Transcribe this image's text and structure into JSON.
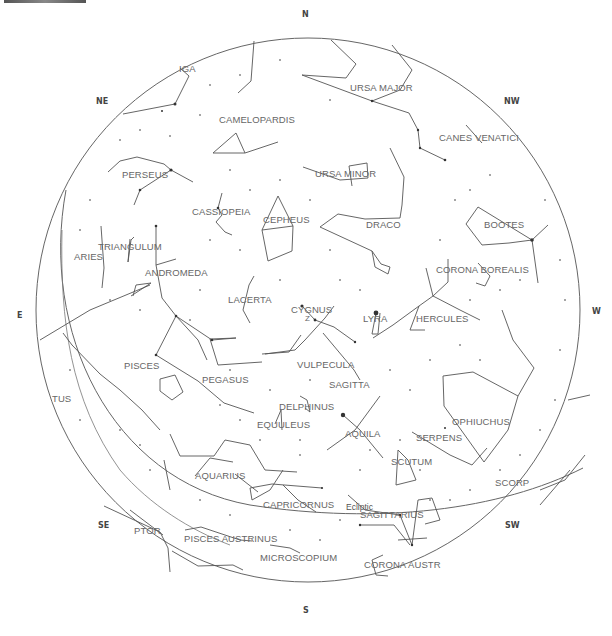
{
  "directions": [
    {
      "label": "N",
      "x": 306,
      "y": 14
    },
    {
      "label": "NE",
      "x": 98,
      "y": 101
    },
    {
      "label": "NW",
      "x": 505,
      "y": 101
    },
    {
      "label": "E",
      "x": 17,
      "y": 314
    },
    {
      "label": "W",
      "x": 594,
      "y": 311
    },
    {
      "label": "SE",
      "x": 99,
      "y": 524
    },
    {
      "label": "SW",
      "x": 506,
      "y": 524
    },
    {
      "label": "S",
      "x": 305,
      "y": 610
    }
  ],
  "constellations": [
    {
      "name": "IGA",
      "x": 179,
      "y": 66
    },
    {
      "name": "URSA MAJOR",
      "x": 350,
      "y": 85
    },
    {
      "name": "CAMELOPARDIS",
      "x": 219,
      "y": 117
    },
    {
      "name": "CANES VENATICI",
      "x": 439,
      "y": 135
    },
    {
      "name": "PERSEUS",
      "x": 122,
      "y": 172
    },
    {
      "name": "URSA MINOR",
      "x": 315,
      "y": 171
    },
    {
      "name": "CASSIOPEIA",
      "x": 192,
      "y": 209
    },
    {
      "name": "CEPHEUS",
      "x": 263,
      "y": 217
    },
    {
      "name": "DRACO",
      "x": 366,
      "y": 222
    },
    {
      "name": "BOOTES",
      "x": 484,
      "y": 222
    },
    {
      "name": "TRIANGULUM",
      "x": 98,
      "y": 244
    },
    {
      "name": "ARIES",
      "x": 74,
      "y": 251
    },
    {
      "name": "ANDROMEDA",
      "x": 145,
      "y": 268
    },
    {
      "name": "CORONA BOREALIS",
      "x": 436,
      "y": 267
    },
    {
      "name": "LACERTA",
      "x": 228,
      "y": 296
    },
    {
      "name": "CYGNUS",
      "x": 291,
      "y": 306
    },
    {
      "name": "LYRA",
      "x": 363,
      "y": 316
    },
    {
      "name": "HERCULES",
      "x": 416,
      "y": 315
    },
    {
      "name": "PISCES",
      "x": 124,
      "y": 361
    },
    {
      "name": "VULPECULA",
      "x": 297,
      "y": 361
    },
    {
      "name": "PEGASUS",
      "x": 202,
      "y": 376
    },
    {
      "name": "SAGITTA",
      "x": 329,
      "y": 380
    },
    {
      "name": "TUS",
      "x": 52,
      "y": 395
    },
    {
      "name": "DELPHINUS",
      "x": 279,
      "y": 403
    },
    {
      "name": "OPHIUCHUS",
      "x": 452,
      "y": 418
    },
    {
      "name": "EQUULEUS",
      "x": 257,
      "y": 420
    },
    {
      "name": "AQUILA",
      "x": 345,
      "y": 430
    },
    {
      "name": "SERPENS",
      "x": 416,
      "y": 433
    },
    {
      "name": "SCUTUM",
      "x": 391,
      "y": 458
    },
    {
      "name": "AQUARIUS",
      "x": 195,
      "y": 471
    },
    {
      "name": "SCORP",
      "x": 495,
      "y": 478
    },
    {
      "name": "CAPRICORNUS",
      "x": 263,
      "y": 501
    },
    {
      "name": "SAGITTARIUS",
      "x": 360,
      "y": 511
    },
    {
      "name": "PTOR",
      "x": 134,
      "y": 526
    },
    {
      "name": "PISCES AUSTRINUS",
      "x": 184,
      "y": 534
    },
    {
      "name": "MICROSCOPIUM",
      "x": 260,
      "y": 554
    },
    {
      "name": "CORONA AUSTR",
      "x": 364,
      "y": 560
    }
  ],
  "annotations": {
    "ecliptic_label": "Ecliptic",
    "zenith_marker": "Z"
  },
  "colors": {
    "line": "#555555",
    "star": "#333333",
    "label": "#666666",
    "background": "#ffffff"
  }
}
